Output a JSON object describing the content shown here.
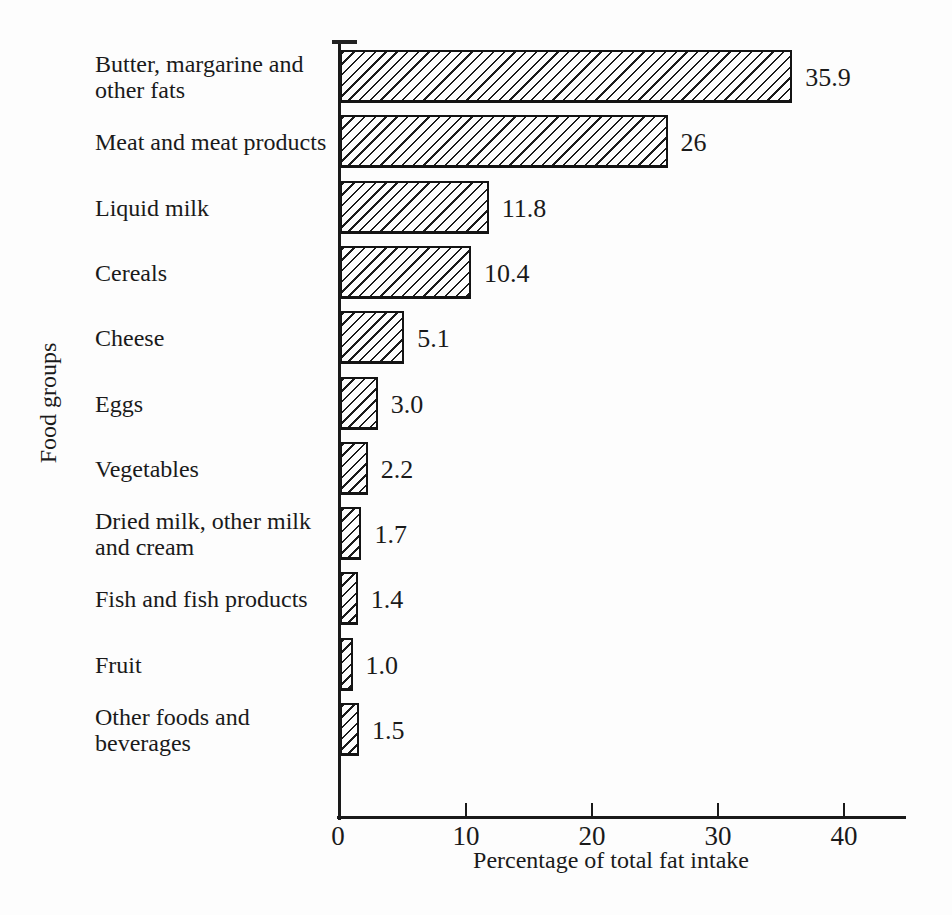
{
  "figure": {
    "x_axis_title": "Percentage of total fat intake",
    "y_axis_title": "Food groups",
    "tick_labels": [
      "0",
      "10",
      "20",
      "30",
      "40"
    ]
  },
  "colors": {
    "ink": "#1a1a1a",
    "paper": "#fdfdfd",
    "bar_fill": "#fdfdfd",
    "hatch": "#1b1b1b"
  },
  "rows": [
    {
      "label_lines": [
        "Butter, margarine and",
        "other fats"
      ],
      "value": 35.9,
      "value_label": "35.9"
    },
    {
      "label_lines": [
        "Meat and meat products"
      ],
      "value": 26,
      "value_label": "26"
    },
    {
      "label_lines": [
        "Liquid milk"
      ],
      "value": 11.8,
      "value_label": "11.8"
    },
    {
      "label_lines": [
        "Cereals"
      ],
      "value": 10.4,
      "value_label": "10.4"
    },
    {
      "label_lines": [
        "Cheese"
      ],
      "value": 5.1,
      "value_label": "5.1"
    },
    {
      "label_lines": [
        "Eggs"
      ],
      "value": 3.0,
      "value_label": "3.0"
    },
    {
      "label_lines": [
        "Vegetables"
      ],
      "value": 2.2,
      "value_label": "2.2"
    },
    {
      "label_lines": [
        "Dried milk, other milk",
        "and cream"
      ],
      "value": 1.7,
      "value_label": "1.7"
    },
    {
      "label_lines": [
        "Fish and fish products"
      ],
      "value": 1.4,
      "value_label": "1.4"
    },
    {
      "label_lines": [
        "Fruit"
      ],
      "value": 1.0,
      "value_label": "1.0"
    },
    {
      "label_lines": [
        "Other foods and beverages"
      ],
      "value": 1.5,
      "value_label": "1.5"
    }
  ],
  "chart_data": {
    "type": "bar",
    "orientation": "horizontal",
    "title": "",
    "xlabel": "Percentage of total fat intake",
    "ylabel": "Food groups",
    "categories": [
      "Butter, margarine and other fats",
      "Meat and meat products",
      "Liquid milk",
      "Cereals",
      "Cheese",
      "Eggs",
      "Vegetables",
      "Dried milk, other milk and cream",
      "Fish and fish products",
      "Fruit",
      "Other foods and beverages"
    ],
    "values": [
      35.9,
      26,
      11.8,
      10.4,
      5.1,
      3.0,
      2.2,
      1.7,
      1.4,
      1.0,
      1.5
    ],
    "value_labels": [
      "35.9",
      "26",
      "11.8",
      "10.4",
      "5.1",
      "3.0",
      "2.2",
      "1.7",
      "1.4",
      "1.0",
      "1.5"
    ],
    "xlim": [
      0,
      45
    ],
    "x_ticks": [
      0,
      10,
      20,
      30,
      40
    ],
    "grid": false,
    "legend": "none",
    "bar_style": "white fill with black diagonal hatching, black outline"
  }
}
